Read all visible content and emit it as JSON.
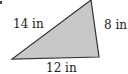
{
  "figure": {
    "type": "triangle",
    "fill_color": "#c8c8c8",
    "stroke_color": "#333333",
    "vertices": {
      "top": [
        91,
        0
      ],
      "bottom_right": [
        99,
        57
      ],
      "bottom_left": [
        12,
        59
      ]
    },
    "labels": {
      "hypotenuse": "14 in",
      "right_side": "8 in",
      "base": "12 in"
    }
  }
}
